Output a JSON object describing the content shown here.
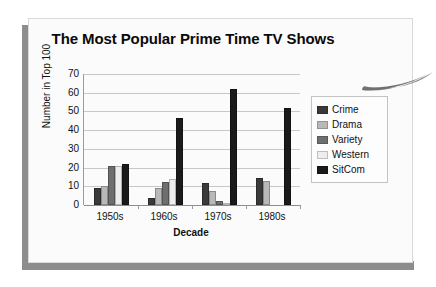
{
  "document": {
    "type": "printed-page-figure"
  },
  "chart_data": {
    "type": "bar",
    "title": "The Most Popular Prime Time TV Shows",
    "xlabel": "Decade",
    "ylabel": "Number in Top 100",
    "categories": [
      "1950s",
      "1960s",
      "1970s",
      "1980s"
    ],
    "ylim": [
      0,
      70
    ],
    "ytick_step": 10,
    "yticks": [
      70,
      60,
      50,
      40,
      30,
      20,
      10,
      0
    ],
    "grid": true,
    "legend_position": "right",
    "series": [
      {
        "name": "Crime",
        "color": "#3a3a3a",
        "values": [
          9,
          4,
          11.5,
          14.5
        ]
      },
      {
        "name": "Drama",
        "color": "#b8b8b8",
        "values": [
          10,
          9,
          7.5,
          13
        ]
      },
      {
        "name": "Variety",
        "color": "#6e6e6e",
        "values": [
          21,
          12.5,
          2,
          0
        ]
      },
      {
        "name": "Western",
        "color": "#eeeeee",
        "values": [
          21,
          14,
          1,
          0
        ]
      },
      {
        "name": "SitCom",
        "color": "#1a1a1a",
        "values": [
          22,
          46.5,
          62,
          52
        ]
      }
    ]
  }
}
